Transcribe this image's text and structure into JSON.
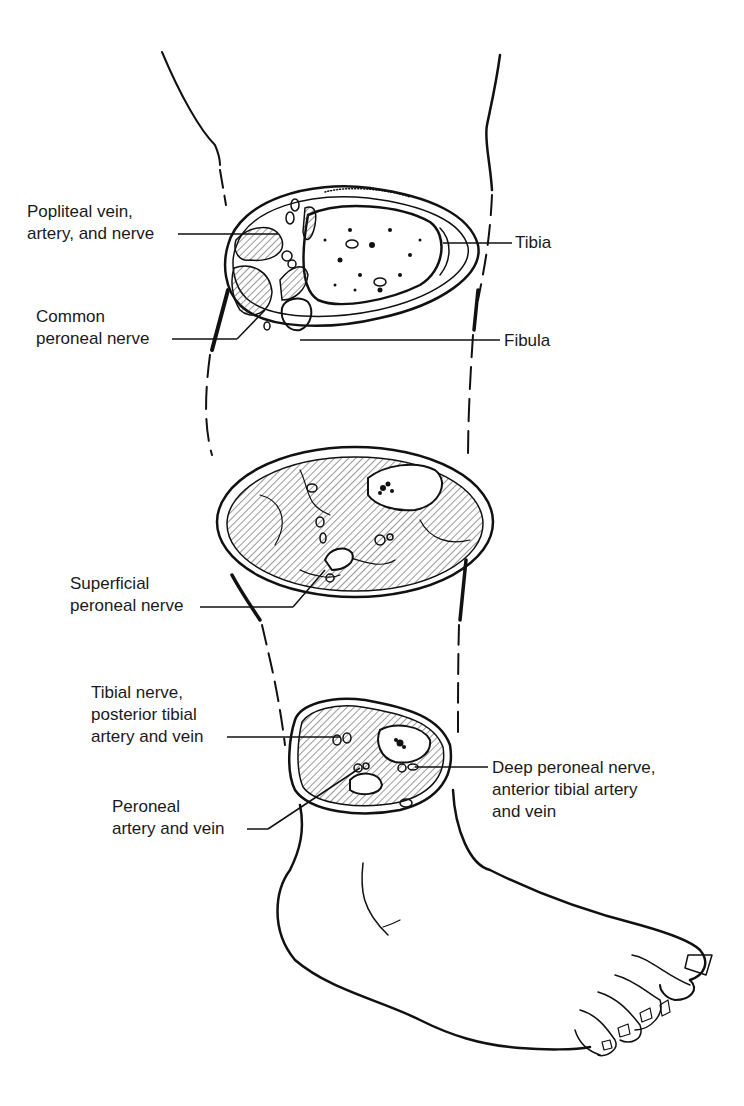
{
  "figure": {
    "colors": {
      "ink": "#111111",
      "background": "#ffffff",
      "hatch": "#333333"
    }
  },
  "labels": {
    "popliteal": {
      "line1": "Popliteal vein,",
      "line2": "artery, and nerve"
    },
    "common_peroneal": {
      "line1": "Common",
      "line2": "peroneal nerve"
    },
    "tibia": {
      "line1": "Tibia"
    },
    "fibula": {
      "line1": "Fibula"
    },
    "superficial_peroneal": {
      "line1": "Superficial",
      "line2": "peroneal nerve"
    },
    "tibial_nerve": {
      "line1": "Tibial nerve,",
      "line2": "posterior tibial",
      "line3": "artery and vein"
    },
    "deep_peroneal": {
      "line1": "Deep peroneal nerve,",
      "line2": "anterior tibial artery",
      "line3": "and vein"
    },
    "peroneal_artery": {
      "line1": "Peroneal",
      "line2": "artery and vein"
    }
  },
  "sections": [
    {
      "id": "upper",
      "level": "proximal leg (knee)"
    },
    {
      "id": "middle",
      "level": "mid-calf"
    },
    {
      "id": "lower",
      "level": "distal leg (ankle)"
    }
  ]
}
